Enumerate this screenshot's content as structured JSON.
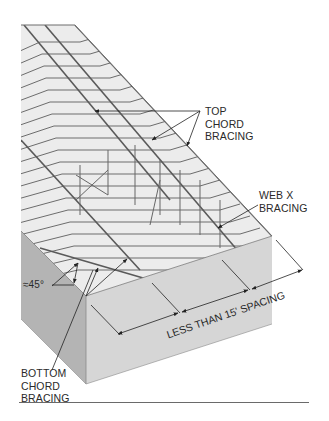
{
  "figure": {
    "colors": {
      "background": "#ffffff",
      "roof_surface": "#ececec",
      "wall_front": "#d6d6d6",
      "wall_side": "#b4b4b4",
      "truss_line": "#6c6c6c",
      "text": "#2a2a2a",
      "rule": "#6a6a6a"
    }
  },
  "labels": {
    "top_chord_bracing": "TOP\nCHORD\nBRACING",
    "web_x_bracing": "WEB X\nBRACING",
    "angle": "≈45°",
    "spacing": "LESS THAN 15' SPACING",
    "bottom_chord_bracing": "BOTTOM\nCHORD\nBRACING"
  }
}
